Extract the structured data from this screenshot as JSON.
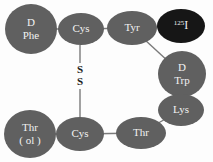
{
  "diagram": {
    "background_color": "#fdfdfd",
    "node_fill": "#606060",
    "node_fill_dark": "#161616",
    "node_text_color": "#f2f2f2",
    "bond_color": "#7a7a7a",
    "bridge_text_color": "#1c1c1c",
    "nodes": [
      {
        "id": "d-phe",
        "line1": "D",
        "line2": "Phe",
        "cx": 31,
        "cy": 29,
        "rx": 26,
        "ry": 25,
        "fill": "#606060",
        "font_size": 11,
        "two_line": true
      },
      {
        "id": "cys-top",
        "line1": "Cys",
        "line2": "",
        "cx": 81,
        "cy": 29,
        "rx": 23,
        "ry": 16,
        "fill": "#606060",
        "font_size": 11,
        "two_line": false
      },
      {
        "id": "tyr",
        "line1": "Tyr",
        "line2": "",
        "cx": 132,
        "cy": 28,
        "rx": 25,
        "ry": 17,
        "fill": "#606060",
        "font_size": 11,
        "two_line": false
      },
      {
        "id": "iodine-125",
        "line1": "I",
        "line2": "",
        "cx": 181,
        "cy": 26,
        "rx": 24,
        "ry": 17,
        "fill": "#161616",
        "font_size": 12,
        "two_line": false,
        "superscript": "125"
      },
      {
        "id": "d-trp",
        "line1": "D",
        "line2": "Trp",
        "cx": 182,
        "cy": 74,
        "rx": 24,
        "ry": 23,
        "fill": "#606060",
        "font_size": 11,
        "two_line": true
      },
      {
        "id": "lys",
        "line1": "Lys",
        "line2": "",
        "cx": 181,
        "cy": 110,
        "rx": 23,
        "ry": 16,
        "fill": "#606060",
        "font_size": 11,
        "two_line": false
      },
      {
        "id": "thr-bottom",
        "line1": "Thr",
        "line2": "",
        "cx": 141,
        "cy": 133,
        "rx": 25,
        "ry": 16,
        "fill": "#606060",
        "font_size": 11,
        "two_line": false
      },
      {
        "id": "cys-bottom",
        "line1": "Cys",
        "line2": "",
        "cx": 80,
        "cy": 134,
        "rx": 24,
        "ry": 17,
        "fill": "#606060",
        "font_size": 11,
        "two_line": false
      },
      {
        "id": "thr-ol",
        "line1": "Thr",
        "line2": "( ol )",
        "cx": 30,
        "cy": 134,
        "rx": 26,
        "ry": 24,
        "fill": "#606060",
        "font_size": 11,
        "two_line": true
      }
    ],
    "bonds": [
      {
        "id": "bond-dphe-cys",
        "x1": 56,
        "y1": 29,
        "x2": 59,
        "y2": 29
      },
      {
        "id": "bond-cys-tyr",
        "x1": 103,
        "y1": 28,
        "x2": 108,
        "y2": 28
      },
      {
        "id": "bond-tyr-iodine",
        "x1": 156,
        "y1": 26,
        "x2": 158,
        "y2": 26
      },
      {
        "id": "bond-tyr-dtrp",
        "x1": 146,
        "y1": 39,
        "x2": 168,
        "y2": 54
      },
      {
        "id": "bond-dtrp-lys",
        "x1": 182,
        "y1": 96,
        "x2": 182,
        "y2": 95
      },
      {
        "id": "bond-lys-thr",
        "x1": 176,
        "y1": 124,
        "x2": 158,
        "y2": 136
      },
      {
        "id": "bond-thr-cysbottom",
        "x1": 117,
        "y1": 133,
        "x2": 104,
        "y2": 133
      },
      {
        "id": "bond-cysbottom-throl",
        "x1": 56,
        "y1": 134,
        "x2": 57,
        "y2": 134
      },
      {
        "id": "bond-disulfide-upper",
        "x1": 80,
        "y1": 45,
        "x2": 80,
        "y2": 62
      },
      {
        "id": "bond-disulfide-lower",
        "x1": 80,
        "y1": 88,
        "x2": 80,
        "y2": 117
      }
    ],
    "disulfide_bridge": {
      "id": "disulfide-bridge",
      "label_top": "S",
      "label_bottom": "S",
      "x": 80,
      "y_top": 70,
      "y_bottom": 82,
      "font_size": 11
    }
  }
}
